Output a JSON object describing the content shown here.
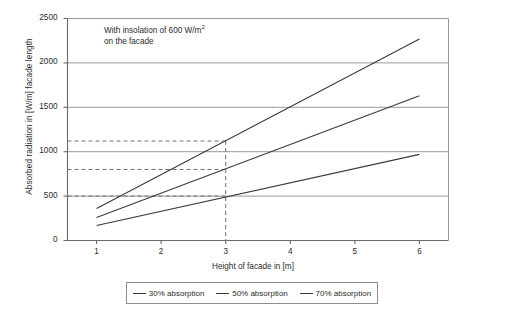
{
  "chart_data": {
    "type": "line",
    "title": "",
    "xlabel": "Height of facade in [m]",
    "ylabel": "Absorbed radiation in [W/m] facade length",
    "annotation_line1": "With insolation of 600 W/m",
    "annotation_sup": "2",
    "annotation_line2": "on the facade",
    "xlim": [
      0.55,
      6.45
    ],
    "ylim": [
      0,
      2500
    ],
    "xticks": [
      1,
      2,
      3,
      4,
      5,
      6
    ],
    "xtick_labels": [
      "1",
      "2",
      "3",
      "4",
      "5",
      "6"
    ],
    "yticks": [
      0,
      500,
      1000,
      1500,
      2000,
      2500
    ],
    "ytick_labels": [
      "0",
      "500",
      "1000",
      "1500",
      "2000",
      "2500"
    ],
    "grid": "horizontal",
    "legend_position": "below",
    "x": [
      1,
      6
    ],
    "series": [
      {
        "name": "30% absorption",
        "values": [
          170,
          970
        ],
        "color": "#3a3a3a"
      },
      {
        "name": "50% absorption",
        "values": [
          260,
          1630
        ],
        "color": "#3a3a3a"
      },
      {
        "name": "70% absorption",
        "values": [
          360,
          2270
        ],
        "color": "#3a3a3a"
      }
    ],
    "guide_lines": {
      "vertical_x": 3,
      "horizontal_y": [
        500,
        800,
        1120
      ],
      "style": "dashed",
      "color": "#6f6f6f"
    },
    "readings_at_x3": [
      {
        "series": "30% absorption",
        "value": 500
      },
      {
        "series": "50% absorption",
        "value": 800
      },
      {
        "series": "70% absorption",
        "value": 1120
      }
    ]
  },
  "legend": {
    "items": [
      {
        "label": "30% absorption"
      },
      {
        "label": "50% absorption"
      },
      {
        "label": "70% absorption"
      }
    ]
  }
}
